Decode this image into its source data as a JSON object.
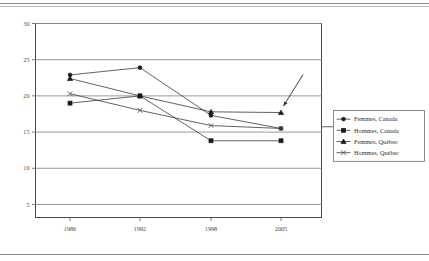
{
  "chart_data": {
    "type": "line",
    "title": "",
    "subtitle": "",
    "xlabel": "",
    "ylabel": "",
    "categories": [
      "1986",
      "1992",
      "1998",
      "2005"
    ],
    "x_tick_labels": [
      "1986",
      "1992",
      "1998",
      "2005"
    ],
    "y_tick_labels": [
      "5",
      "10",
      "15",
      "20",
      "25",
      "30"
    ],
    "y_ticks": [
      5,
      10,
      15,
      20,
      25,
      30
    ],
    "ylim": [
      3.2,
      30
    ],
    "grid": true,
    "grid_axis": "y",
    "legend_position": "right",
    "series": [
      {
        "name": "Femmes, Canada",
        "marker": "circle",
        "values": [
          22.9,
          23.9,
          17.3,
          15.5
        ]
      },
      {
        "name": "Hommes, Canada",
        "marker": "square",
        "values": [
          19.0,
          20.0,
          13.8,
          13.8
        ]
      },
      {
        "name": "Femmes, Québec",
        "marker": "triangle",
        "values": [
          22.4,
          20.0,
          17.8,
          17.7
        ]
      },
      {
        "name": "Hommes, Québec",
        "marker": "x",
        "values": [
          20.3,
          18.0,
          15.9,
          15.5
        ]
      }
    ],
    "annotations": [
      {
        "type": "arrow",
        "target_series": "Femmes, Québec",
        "target_category": "2005",
        "text": ""
      }
    ]
  },
  "legend": {
    "items": [
      {
        "label": "Femmes, Canada",
        "marker": "circle-marker"
      },
      {
        "label": "Hommes, Canada",
        "marker": "square-marker"
      },
      {
        "label": "Femmes, Québec",
        "marker": "triangle-marker"
      },
      {
        "label": "Hommes, Québec",
        "marker": "x-marker"
      }
    ]
  }
}
